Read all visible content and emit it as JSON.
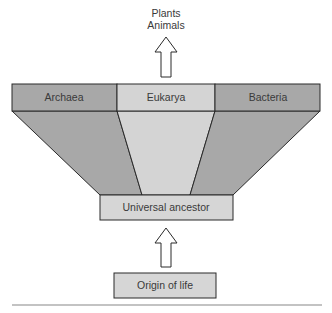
{
  "top_label": {
    "line1": "Plants",
    "line2": "Animals"
  },
  "domains": [
    {
      "label": "Archaea",
      "color": "#a8a8a8"
    },
    {
      "label": "Eukarya",
      "color": "#d4d4d4"
    },
    {
      "label": "Bacteria",
      "color": "#a8a8a8"
    }
  ],
  "ancestor": {
    "label": "Universal ancestor",
    "color": "#d6d6d6"
  },
  "origin": {
    "label": "Origin of life",
    "color": "#d6d6d6"
  },
  "arrows": [
    {
      "name": "arrow-to-plants-animals",
      "direction": "up"
    },
    {
      "name": "arrow-origin-to-ancestor",
      "direction": "up"
    }
  ],
  "colors": {
    "stroke": "#2a2a2a",
    "dark_fill": "#a8a8a8",
    "light_fill": "#d4d4d4",
    "rule": "#888888"
  }
}
